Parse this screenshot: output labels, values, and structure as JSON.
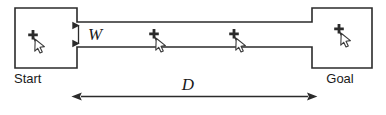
{
  "figure": {
    "labels": {
      "start": "Start",
      "goal": "Goal",
      "width_symbol": "W",
      "distance_symbol": "D"
    },
    "colors": {
      "background": "#ffffff",
      "outline": "#2b2b2b",
      "dimension_line": "#2b2b2b",
      "text": "#1a1a1a",
      "cursor_fill": "#ffffff",
      "cursor_stroke": "#3a3a3a",
      "cursor_cross": "#2b2b2b"
    },
    "geometry": {
      "canvas_width": 386,
      "canvas_height": 115,
      "start_box": {
        "x": 15,
        "y": 8,
        "width": 62,
        "height": 60
      },
      "goal_box": {
        "x": 312,
        "y": 8,
        "width": 60,
        "height": 60
      },
      "corridor": {
        "x": 77,
        "y": 22,
        "width": 235,
        "height": 25
      },
      "width_dimension": {
        "x": 78,
        "y_top": 22,
        "y_bottom": 47
      },
      "distance_dimension": {
        "y": 96,
        "x_left": 77,
        "x_right": 312
      }
    },
    "cursors": [
      {
        "name": "cursor-start",
        "x": 33,
        "y": 31
      },
      {
        "name": "cursor-mid-1",
        "x": 153,
        "y": 32
      },
      {
        "name": "cursor-mid-2",
        "x": 233,
        "y": 32
      },
      {
        "name": "cursor-goal",
        "x": 338,
        "y": 27
      }
    ]
  }
}
